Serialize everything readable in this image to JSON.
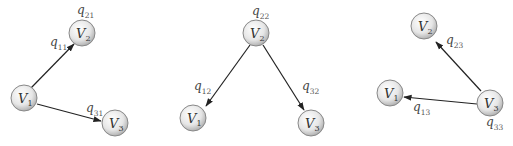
{
  "diagram": {
    "type": "directed-graphs",
    "panels": [
      {
        "nodes": [
          {
            "id": "V1",
            "base": "V",
            "sub": "1"
          },
          {
            "id": "V2",
            "base": "V",
            "sub": "2"
          },
          {
            "id": "V3",
            "base": "V",
            "sub": "3"
          }
        ],
        "edges": [
          {
            "from": "V1",
            "to": "V2"
          },
          {
            "from": "V1",
            "to": "V3"
          }
        ],
        "labels": [
          {
            "base": "q",
            "sub": "11"
          },
          {
            "base": "q",
            "sub": "21"
          },
          {
            "base": "q",
            "sub": "31"
          }
        ]
      },
      {
        "nodes": [
          {
            "id": "V1",
            "base": "V",
            "sub": "1"
          },
          {
            "id": "V2",
            "base": "V",
            "sub": "2"
          },
          {
            "id": "V3",
            "base": "V",
            "sub": "3"
          }
        ],
        "edges": [
          {
            "from": "V2",
            "to": "V1"
          },
          {
            "from": "V2",
            "to": "V3"
          }
        ],
        "labels": [
          {
            "base": "q",
            "sub": "22"
          },
          {
            "base": "q",
            "sub": "12"
          },
          {
            "base": "q",
            "sub": "32"
          }
        ]
      },
      {
        "nodes": [
          {
            "id": "V1",
            "base": "V",
            "sub": "1"
          },
          {
            "id": "V2",
            "base": "V",
            "sub": "2"
          },
          {
            "id": "V3",
            "base": "V",
            "sub": "3"
          }
        ],
        "edges": [
          {
            "from": "V3",
            "to": "V2"
          },
          {
            "from": "V3",
            "to": "V1"
          }
        ],
        "labels": [
          {
            "base": "q",
            "sub": "23"
          },
          {
            "base": "q",
            "sub": "13"
          },
          {
            "base": "q",
            "sub": "33"
          }
        ]
      }
    ]
  }
}
